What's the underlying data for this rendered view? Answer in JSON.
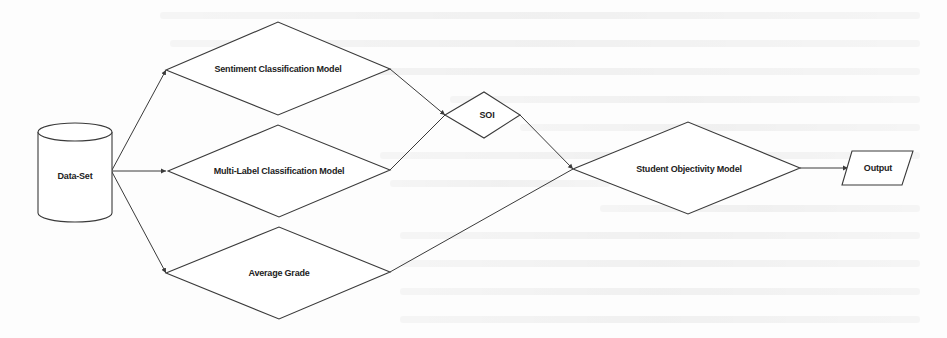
{
  "diagram": {
    "type": "flowchart",
    "nodes": {
      "dataset": {
        "label": "Data-Set",
        "shape": "cylinder"
      },
      "sentiment": {
        "label": "Sentiment Classification Model",
        "shape": "diamond"
      },
      "multilabel": {
        "label": "Multi-Label Classification Model",
        "shape": "diamond"
      },
      "average_grade": {
        "label": "Average Grade",
        "shape": "diamond"
      },
      "soi": {
        "label": "SOI",
        "shape": "diamond"
      },
      "student_objectivity": {
        "label": "Student Objectivity Model",
        "shape": "diamond"
      },
      "output": {
        "label": "Output",
        "shape": "parallelogram"
      }
    },
    "edges": [
      {
        "from": "dataset",
        "to": "sentiment"
      },
      {
        "from": "dataset",
        "to": "multilabel"
      },
      {
        "from": "dataset",
        "to": "average_grade"
      },
      {
        "from": "sentiment",
        "to": "soi"
      },
      {
        "from": "multilabel",
        "to": "soi"
      },
      {
        "from": "soi",
        "to": "student_objectivity"
      },
      {
        "from": "average_grade",
        "to": "student_objectivity"
      },
      {
        "from": "student_objectivity",
        "to": "output"
      }
    ],
    "colors": {
      "stroke": "#3a3a3a",
      "fill": "#ffffff",
      "text": "#222222"
    }
  }
}
